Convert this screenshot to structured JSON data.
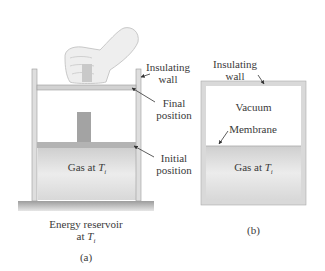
{
  "diagram": {
    "panel_a": {
      "caption": "(a)",
      "labels": {
        "insulating_wall": [
          "Insulating",
          "wall"
        ],
        "final_position": [
          "Final",
          "position"
        ],
        "initial_position": [
          "Initial",
          "position"
        ],
        "gas": "Gas at ",
        "gas_symbol": "T",
        "gas_subscript": "i",
        "reservoir_line1": "Energy reservoir",
        "reservoir_line2": "at ",
        "reservoir_symbol": "T",
        "reservoir_subscript": "i"
      }
    },
    "panel_b": {
      "caption": "(b)",
      "labels": {
        "insulating_wall": [
          "Insulating",
          "wall"
        ],
        "vacuum": "Vacuum",
        "membrane": "Membrane",
        "gas": "Gas at ",
        "gas_symbol": "T",
        "gas_subscript": "i"
      }
    },
    "colors": {
      "wall": "#d9d9d9",
      "wall_stroke": "#9a9a9a",
      "gas": "#dcdcdc",
      "piston": "#bdbdbd",
      "block": "#9e9e9e",
      "reservoir": "#a8a8a8",
      "arrow": "#333333"
    }
  }
}
